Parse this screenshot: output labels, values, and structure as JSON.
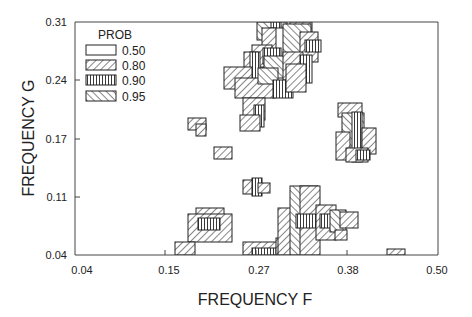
{
  "chart_data": {
    "type": "heatmap",
    "title": "",
    "xlabel": "FREQUENCY F",
    "ylabel": "FREQUENCY G",
    "xlim": [
      0.04,
      0.5
    ],
    "ylim": [
      0.04,
      0.31
    ],
    "x_ticks": [
      "0.04",
      "0.15",
      "0.27",
      "0.38",
      "0.50"
    ],
    "y_ticks": [
      "0.04",
      "0.11",
      "0.17",
      "0.24",
      "0.31"
    ],
    "grid": false,
    "legend": {
      "title": "PROB",
      "position": "upper-left",
      "entries": [
        {
          "label": "0.50",
          "pattern": "empty"
        },
        {
          "label": "0.80",
          "pattern": "hatch-forward"
        },
        {
          "label": "0.90",
          "pattern": "vertical"
        },
        {
          "label": "0.95",
          "pattern": "hatch-back"
        }
      ]
    },
    "cell_size_approx": 0.0115,
    "regions": [
      {
        "name": "upper-cluster",
        "f_range": [
          0.25,
          0.34
        ],
        "g_range": [
          0.19,
          0.31
        ],
        "max_prob": "0.95"
      },
      {
        "name": "right-mid-cluster",
        "f_range": [
          0.35,
          0.39
        ],
        "g_range": [
          0.15,
          0.2
        ],
        "max_prob": "0.95"
      },
      {
        "name": "isolated-left-mid",
        "f_range": [
          0.17,
          0.2
        ],
        "g_range": [
          0.18,
          0.19
        ],
        "max_prob": "0.80"
      },
      {
        "name": "isolated-small-1",
        "f_range": [
          0.21,
          0.23
        ],
        "g_range": [
          0.15,
          0.16
        ],
        "max_prob": "0.80"
      },
      {
        "name": "isolated-small-2",
        "f_range": [
          0.29,
          0.31
        ],
        "g_range": [
          0.11,
          0.13
        ],
        "max_prob": "0.90"
      },
      {
        "name": "lower-left-cluster",
        "f_range": [
          0.17,
          0.24
        ],
        "g_range": [
          0.04,
          0.09
        ],
        "max_prob": "0.90"
      },
      {
        "name": "lower-right-cluster",
        "f_range": [
          0.25,
          0.37
        ],
        "g_range": [
          0.04,
          0.1
        ],
        "max_prob": "0.90"
      },
      {
        "name": "far-right-isolated",
        "f_range": [
          0.41,
          0.43
        ],
        "g_range": [
          0.04,
          0.045
        ],
        "max_prob": "0.80"
      }
    ]
  },
  "cells": [
    {
      "x": 257,
      "y": 22,
      "w": 30,
      "h": 18,
      "p": "b"
    },
    {
      "x": 290,
      "y": 22,
      "w": 22,
      "h": 15,
      "p": "f"
    },
    {
      "x": 271,
      "y": 22,
      "w": 10,
      "h": 52,
      "p": "v"
    },
    {
      "x": 270,
      "y": 28,
      "w": 40,
      "h": 40,
      "p": "e"
    },
    {
      "x": 262,
      "y": 28,
      "w": 14,
      "h": 50,
      "p": "f"
    },
    {
      "x": 283,
      "y": 24,
      "w": 28,
      "h": 42,
      "p": "b"
    },
    {
      "x": 300,
      "y": 32,
      "w": 18,
      "h": 30,
      "p": "f"
    },
    {
      "x": 305,
      "y": 40,
      "w": 16,
      "h": 12,
      "p": "v"
    },
    {
      "x": 252,
      "y": 45,
      "w": 20,
      "h": 22,
      "p": "f"
    },
    {
      "x": 263,
      "y": 48,
      "w": 18,
      "h": 16,
      "p": "v"
    },
    {
      "x": 244,
      "y": 52,
      "w": 14,
      "h": 20,
      "p": "f"
    },
    {
      "x": 250,
      "y": 52,
      "w": 10,
      "h": 30,
      "p": "v"
    },
    {
      "x": 264,
      "y": 56,
      "w": 28,
      "h": 22,
      "p": "b"
    },
    {
      "x": 283,
      "y": 52,
      "w": 20,
      "h": 28,
      "p": "f"
    },
    {
      "x": 300,
      "y": 55,
      "w": 12,
      "h": 28,
      "p": "v"
    },
    {
      "x": 224,
      "y": 67,
      "w": 28,
      "h": 22,
      "p": "f"
    },
    {
      "x": 235,
      "y": 78,
      "w": 40,
      "h": 20,
      "p": "f"
    },
    {
      "x": 258,
      "y": 68,
      "w": 20,
      "h": 16,
      "p": "b"
    },
    {
      "x": 273,
      "y": 80,
      "w": 20,
      "h": 18,
      "p": "v"
    },
    {
      "x": 286,
      "y": 64,
      "w": 20,
      "h": 28,
      "p": "f"
    },
    {
      "x": 243,
      "y": 98,
      "w": 22,
      "h": 22,
      "p": "f"
    },
    {
      "x": 254,
      "y": 105,
      "w": 10,
      "h": 22,
      "p": "v"
    },
    {
      "x": 240,
      "y": 115,
      "w": 20,
      "h": 16,
      "p": "f"
    },
    {
      "x": 338,
      "y": 103,
      "w": 24,
      "h": 14,
      "p": "f"
    },
    {
      "x": 342,
      "y": 113,
      "w": 22,
      "h": 36,
      "p": "b"
    },
    {
      "x": 352,
      "y": 112,
      "w": 10,
      "h": 50,
      "p": "v"
    },
    {
      "x": 362,
      "y": 128,
      "w": 14,
      "h": 26,
      "p": "f"
    },
    {
      "x": 336,
      "y": 132,
      "w": 14,
      "h": 28,
      "p": "f"
    },
    {
      "x": 346,
      "y": 148,
      "w": 22,
      "h": 14,
      "p": "f"
    },
    {
      "x": 356,
      "y": 150,
      "w": 14,
      "h": 10,
      "p": "v"
    },
    {
      "x": 188,
      "y": 118,
      "w": 18,
      "h": 12,
      "p": "f"
    },
    {
      "x": 196,
      "y": 124,
      "w": 10,
      "h": 12,
      "p": "f"
    },
    {
      "x": 214,
      "y": 147,
      "w": 18,
      "h": 12,
      "p": "f"
    },
    {
      "x": 243,
      "y": 180,
      "w": 18,
      "h": 14,
      "p": "f"
    },
    {
      "x": 252,
      "y": 178,
      "w": 10,
      "h": 18,
      "p": "v"
    },
    {
      "x": 258,
      "y": 183,
      "w": 12,
      "h": 10,
      "p": "f"
    },
    {
      "x": 196,
      "y": 208,
      "w": 28,
      "h": 10,
      "p": "f"
    },
    {
      "x": 188,
      "y": 214,
      "w": 44,
      "h": 28,
      "p": "f"
    },
    {
      "x": 198,
      "y": 218,
      "w": 22,
      "h": 12,
      "p": "v"
    },
    {
      "x": 175,
      "y": 242,
      "w": 20,
      "h": 13,
      "p": "f"
    },
    {
      "x": 243,
      "y": 242,
      "w": 35,
      "h": 13,
      "p": "f"
    },
    {
      "x": 252,
      "y": 248,
      "w": 24,
      "h": 7,
      "p": "v"
    },
    {
      "x": 276,
      "y": 238,
      "w": 10,
      "h": 17,
      "p": "f"
    },
    {
      "x": 278,
      "y": 208,
      "w": 18,
      "h": 47,
      "p": "f"
    },
    {
      "x": 290,
      "y": 186,
      "w": 28,
      "h": 69,
      "p": "b"
    },
    {
      "x": 300,
      "y": 186,
      "w": 20,
      "h": 69,
      "p": "f"
    },
    {
      "x": 296,
      "y": 214,
      "w": 26,
      "h": 14,
      "p": "v"
    },
    {
      "x": 316,
      "y": 205,
      "w": 20,
      "h": 35,
      "p": "f"
    },
    {
      "x": 320,
      "y": 214,
      "w": 22,
      "h": 14,
      "p": "v"
    },
    {
      "x": 330,
      "y": 210,
      "w": 16,
      "h": 22,
      "p": "b"
    },
    {
      "x": 340,
      "y": 212,
      "w": 18,
      "h": 16,
      "p": "f"
    },
    {
      "x": 335,
      "y": 230,
      "w": 12,
      "h": 10,
      "p": "f"
    },
    {
      "x": 387,
      "y": 249,
      "w": 18,
      "h": 6,
      "p": "f"
    }
  ]
}
